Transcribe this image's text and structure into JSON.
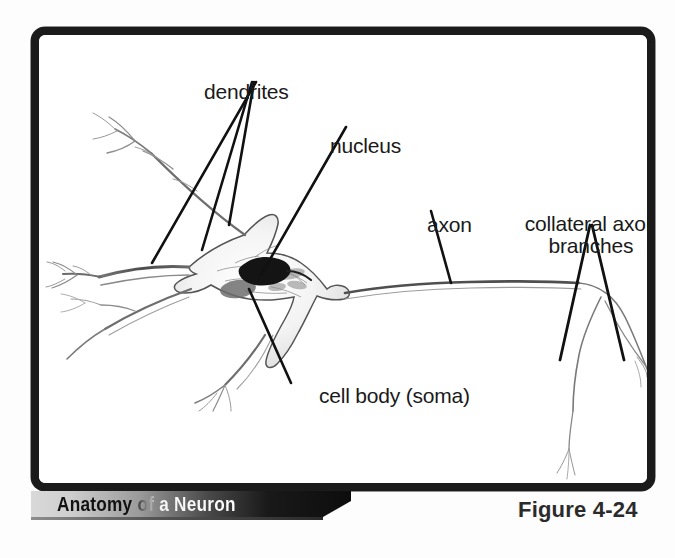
{
  "figure": {
    "banner_title": "Anatomy of a Neuron",
    "figure_number": "Figure 4-24",
    "frame_color": "#1b1b1b",
    "background_color": "#ffffff",
    "label_color": "#1a1a1a"
  },
  "labels": {
    "dendrites": "dendrites",
    "nucleus": "nucleus",
    "axon": "axon",
    "collateral_axon_branches": "collateral axon\nbranches",
    "cell_body": "cell body (soma)"
  },
  "diagram": {
    "subject": "neuron",
    "parts": [
      "dendrites",
      "nucleus",
      "cell body (soma)",
      "axon",
      "collateral axon branches"
    ],
    "ink_color": "#3a3a3a",
    "leader_line_color": "#111111",
    "nucleus_color": "#141414",
    "soma_fill": "#f2f2f2"
  }
}
